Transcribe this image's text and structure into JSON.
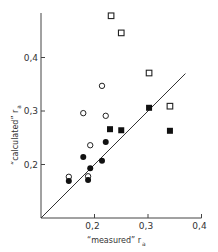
{
  "chart_data": {
    "type": "scatter",
    "title": "",
    "xlabel": "“measured” r",
    "xlabel_subscript": "a",
    "ylabel": "“calculated” r",
    "ylabel_subscript": "a",
    "xlim": [
      0.1,
      0.4
    ],
    "ylim": [
      0.1,
      0.48
    ],
    "x_ticks": [
      {
        "value": 0.2,
        "label": "0,2"
      },
      {
        "value": 0.3,
        "label": "0,3"
      },
      {
        "value": 0.4,
        "label": "0,4"
      }
    ],
    "y_ticks": [
      {
        "value": 0.2,
        "label": "0,2"
      },
      {
        "value": 0.3,
        "label": "0,3"
      },
      {
        "value": 0.4,
        "label": "0,4"
      }
    ],
    "grid": false,
    "legend": null,
    "reference_line": {
      "type": "y=x",
      "from": [
        0.1,
        0.1
      ],
      "to": [
        0.37,
        0.37
      ]
    },
    "series": [
      {
        "name": "open squares",
        "marker": "square-open",
        "points": [
          [
            0.231,
            0.478
          ],
          [
            0.25,
            0.446
          ],
          [
            0.302,
            0.371
          ],
          [
            0.341,
            0.309
          ]
        ]
      },
      {
        "name": "filled squares",
        "marker": "square-filled",
        "points": [
          [
            0.229,
            0.266
          ],
          [
            0.25,
            0.264
          ],
          [
            0.302,
            0.306
          ],
          [
            0.341,
            0.263
          ]
        ]
      },
      {
        "name": "open circles",
        "marker": "circle-open",
        "points": [
          [
            0.214,
            0.347
          ],
          [
            0.179,
            0.296
          ],
          [
            0.221,
            0.291
          ],
          [
            0.192,
            0.236
          ],
          [
            0.152,
            0.177
          ],
          [
            0.188,
            0.178
          ]
        ]
      },
      {
        "name": "filled circles",
        "marker": "circle-filled",
        "points": [
          [
            0.221,
            0.242
          ],
          [
            0.179,
            0.214
          ],
          [
            0.214,
            0.207
          ],
          [
            0.192,
            0.193
          ],
          [
            0.152,
            0.169
          ],
          [
            0.188,
            0.171
          ]
        ]
      }
    ]
  }
}
